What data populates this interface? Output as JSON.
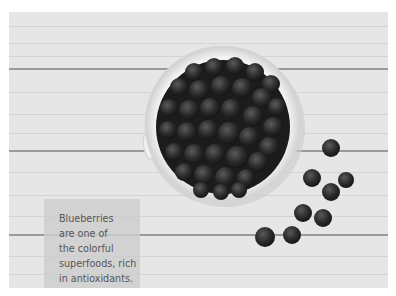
{
  "photo": {
    "subject": "bowl of blueberries on white wooden planks",
    "style": "grayscale",
    "background_color": "#e6e6e6",
    "plank_line_color": "#9a9a9a",
    "bowl_color": "#f2f2f2",
    "berry_color": "#2a2a2a"
  },
  "caption": {
    "text": "Blueberries\nare one of\nthe colorful\nsuperfoods, rich\nin antioxidants.",
    "lines": [
      "Blueberries",
      "are one of",
      "the colorful",
      "superfoods, rich",
      "in antioxidants."
    ],
    "text_color": "#555555",
    "box_color": "#cdcdcd"
  }
}
